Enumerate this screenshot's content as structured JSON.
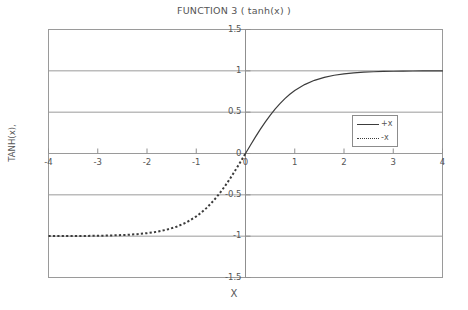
{
  "chart_data": {
    "type": "line",
    "title": "FUNCTION 3 ( tanh(x) )",
    "xlabel": "X",
    "ylabel": "TANH(x),",
    "xlim": [
      -4,
      4
    ],
    "ylim": [
      -1.5,
      1.5
    ],
    "grid": true,
    "grid_axis": "y",
    "legend_position": "right-center",
    "xticks": [
      "-4",
      "-3",
      "-2",
      "-1",
      "0",
      "1",
      "2",
      "3",
      "4"
    ],
    "xtick_values": [
      -4,
      -3,
      -2,
      -1,
      0,
      1,
      2,
      3,
      4
    ],
    "yticks": [
      "1.5",
      "1",
      "0.5",
      "0",
      "-0.5",
      "-1",
      "-1.5"
    ],
    "ytick_values": [
      1.5,
      1,
      0.5,
      0,
      -0.5,
      -1,
      -1.5
    ],
    "series": [
      {
        "name": "+x",
        "style": "solid",
        "color": "#3c3c3c",
        "x": [
          0,
          0.1,
          0.2,
          0.3,
          0.4,
          0.5,
          0.6,
          0.7,
          0.8,
          0.9,
          1,
          1.2,
          1.4,
          1.6,
          1.8,
          2,
          2.2,
          2.4,
          2.6,
          2.8,
          3,
          3.2,
          3.4,
          3.6,
          3.8,
          4
        ],
        "values": [
          0,
          0.0997,
          0.1974,
          0.2913,
          0.3799,
          0.4621,
          0.537,
          0.6044,
          0.664,
          0.7163,
          0.7616,
          0.8337,
          0.8854,
          0.9217,
          0.9468,
          0.964,
          0.9757,
          0.9837,
          0.989,
          0.9926,
          0.995,
          0.9967,
          0.9978,
          0.9985,
          0.999,
          0.9993
        ]
      },
      {
        "name": "-x",
        "style": "dotted",
        "color": "#3c3c3c",
        "x": [
          -4,
          -3.8,
          -3.6,
          -3.4,
          -3.2,
          -3,
          -2.8,
          -2.6,
          -2.4,
          -2.2,
          -2,
          -1.8,
          -1.6,
          -1.4,
          -1.2,
          -1,
          -0.9,
          -0.8,
          -0.7,
          -0.6,
          -0.5,
          -0.4,
          -0.3,
          -0.2,
          -0.1,
          0
        ],
        "values": [
          -0.9993,
          -0.999,
          -0.9985,
          -0.9978,
          -0.9967,
          -0.995,
          -0.9926,
          -0.989,
          -0.9837,
          -0.9757,
          -0.964,
          -0.9468,
          -0.9217,
          -0.8854,
          -0.8337,
          -0.7616,
          -0.7163,
          -0.664,
          -0.6044,
          -0.537,
          -0.4621,
          -0.3799,
          -0.2913,
          -0.1974,
          -0.0997,
          0
        ]
      }
    ]
  },
  "legend": {
    "entries": [
      {
        "label": "+x"
      },
      {
        "label": "-x"
      }
    ]
  }
}
